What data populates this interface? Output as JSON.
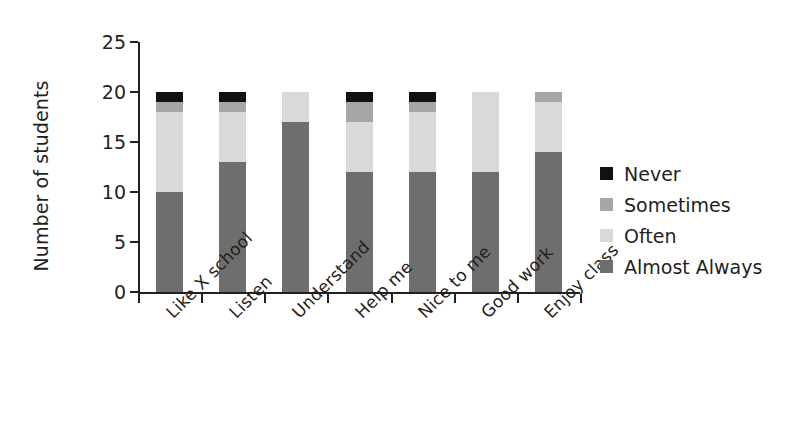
{
  "chart_data": {
    "type": "bar",
    "variant": "stacked-vertical",
    "title": "",
    "subtitle": "",
    "xlabel": "",
    "ylabel": "Number of students",
    "ylim": [
      0,
      25
    ],
    "yticks": [
      0,
      5,
      10,
      15,
      20,
      25
    ],
    "ytick_labels": [
      "0",
      "5",
      "10",
      "15",
      "20",
      "25"
    ],
    "grid": false,
    "legend_position": "right",
    "categories": [
      "Like X school",
      "Listen",
      "Understand",
      "Help me",
      "Nice to me",
      "Good work",
      "Enjoy class"
    ],
    "series": [
      {
        "name": "Almost Always",
        "color": "#6e6e6e",
        "values": [
          10,
          13,
          17,
          12,
          12,
          12,
          14
        ]
      },
      {
        "name": "Often",
        "color": "#d9d9d9",
        "values": [
          8,
          5,
          3,
          5,
          6,
          8,
          5
        ]
      },
      {
        "name": "Sometimes",
        "color": "#a6a6a6",
        "values": [
          1,
          1,
          0,
          2,
          1,
          0,
          1
        ]
      },
      {
        "name": "Never",
        "color": "#111111",
        "values": [
          1,
          1,
          0,
          1,
          1,
          0,
          0
        ]
      }
    ],
    "totals": [
      20,
      20,
      20,
      20,
      20,
      20,
      20
    ]
  },
  "axis": {
    "y_title": "Number of students",
    "y_tick_labels": [
      "25",
      "20",
      "15",
      "10",
      "5",
      "0"
    ],
    "x_tick_labels": [
      "Like X school",
      "Listen",
      "Understand",
      "Help me",
      "Nice to me",
      "Good work",
      "Enjoy class"
    ]
  },
  "legend": {
    "entries": [
      {
        "label": "Never",
        "color": "#111111"
      },
      {
        "label": "Sometimes",
        "color": "#a6a6a6"
      },
      {
        "label": "Often",
        "color": "#d9d9d9"
      },
      {
        "label": "Almost Always",
        "color": "#6e6e6e"
      }
    ]
  },
  "colors": {
    "axis": "#231f20",
    "text": "#231f20",
    "background": "#ffffff",
    "never": "#111111",
    "sometimes": "#a6a6a6",
    "often": "#d9d9d9",
    "almost_always": "#6e6e6e"
  }
}
